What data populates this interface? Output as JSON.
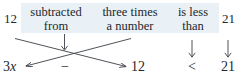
{
  "figure": {
    "type": "word-phrase-to-inequality-translation",
    "highlight_color": "#e9f1f6",
    "ink_color": "#23262b"
  },
  "phrase_row": {
    "items": [
      {
        "name": "twelve",
        "line1": "12",
        "line2": ""
      },
      {
        "name": "subtracted-from",
        "line1": "subtracted",
        "line2": "from"
      },
      {
        "name": "three-times-a-number",
        "line1": "three times",
        "line2": "a number"
      },
      {
        "name": "is-less-than",
        "line1": "is less",
        "line2": "than"
      },
      {
        "name": "twenty-one",
        "line1": "21",
        "line2": ""
      }
    ]
  },
  "expression_row": {
    "items": [
      {
        "name": "three-x",
        "coefficient": "3",
        "variable": "x"
      },
      {
        "name": "minus-sign",
        "text": "−"
      },
      {
        "name": "twelve",
        "text": "12"
      },
      {
        "name": "less-than-sign",
        "text": "<"
      },
      {
        "name": "twenty-one",
        "text": "21"
      }
    ]
  },
  "arrows": {
    "cross_left_to_right": "12 maps to the 12 on the right of the minus sign",
    "cross_right_to_left": "three times a number maps to 3x on the left",
    "down_subtracted_from": "subtracted from maps to the minus sign",
    "down_is_less_than": "is less than maps to the < sign",
    "down_twenty_one": "21 maps to 21"
  }
}
